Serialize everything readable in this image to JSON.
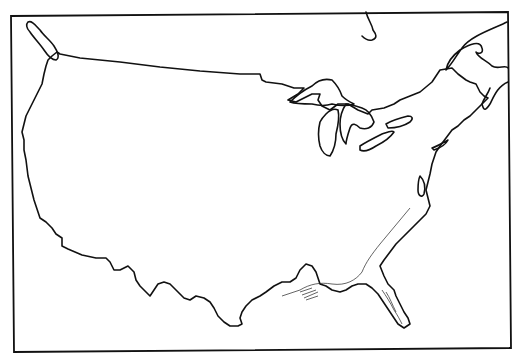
{
  "map": {
    "subject": "Outline map of the contiguous United States",
    "features": [
      "coastline",
      "northern border",
      "Great Lakes",
      "Puget Sound",
      "Hudson Bay edge",
      "Gulf coast",
      "Florida peninsula"
    ],
    "colors": {
      "background": "#ffffff",
      "line": "#111111"
    },
    "labels": []
  }
}
